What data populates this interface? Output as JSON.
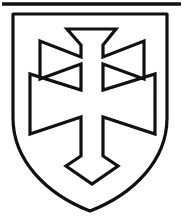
{
  "figure": {
    "title": "Heraldic shield with double cross",
    "width": 184,
    "height": 218,
    "background_color": "#ffffff",
    "ink_color": "#111111"
  },
  "top_rule": {
    "name": "horizontal-rule",
    "x1": 2,
    "y1": 4,
    "x2": 181,
    "y2": 4,
    "thickness": 3.5,
    "color": "#111111"
  },
  "shield": {
    "name": "shield-escutcheon",
    "stroke_color": "#111111",
    "fill_color": "#ffffff",
    "stroke_width": 3.2,
    "top_left_x": 12,
    "top_right_x": 168,
    "top_y": 13,
    "bottom_point_x": 90,
    "bottom_point_y": 212,
    "path": "M 13 14 L 167 14 L 167 118 C 167 160 134 194 90 211 C 46 194 13 160 13 118 Z"
  },
  "cross": {
    "name": "double-cross-patty-fitchy",
    "description": "Patriarchal cross with flared arms and pointed foot",
    "stroke_color": "#111111",
    "fill_color": "#ffffff",
    "stroke_width": 3.2,
    "shaft_left_x": 81,
    "shaft_right_x": 103,
    "upper_arm_left_x": 38,
    "upper_arm_right_x": 146,
    "lower_arm_left_x": 30,
    "lower_arm_right_x": 155,
    "top_y": 28,
    "foot_point_y": 186,
    "path": "M 67 29 L 116 29 L 103 45 L 103 57 L 144 41 L 144 79 L 103 64 L 103 90 L 155 74 L 155 134 L 103 117 L 103 156 L 118 166 L 92 184 L 66 166 L 81 156 L 81 117 L 30 134 L 30 74 L 81 90 L 81 64 L 40 79 L 40 41 L 81 57 L 81 45 Z"
  },
  "labels": {
    "figure_alt": "Coat of arms: silver double cross on a shield"
  }
}
